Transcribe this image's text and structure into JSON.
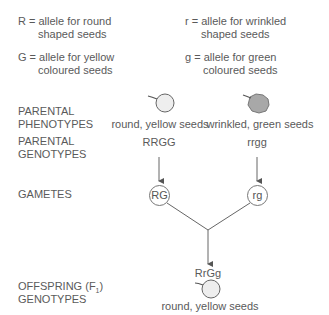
{
  "key": {
    "R": {
      "line1": "R = allele for round",
      "line2": "shaped seeds"
    },
    "r": {
      "line1": "r = allele for wrinkled",
      "line2": "shaped seeds"
    },
    "G": {
      "line1": "G = allele for yellow",
      "line2": "coloured seeds"
    },
    "g": {
      "line1": "g = allele for green",
      "line2": "coloured seeds"
    }
  },
  "rows": {
    "parental_phenotypes": {
      "line1": "PARENTAL",
      "line2": "PHENOTYPES"
    },
    "parental_genotypes": {
      "line1": "PARENTAL",
      "line2": "GENOTYPES"
    },
    "gametes": "GAMETES",
    "offspring": {
      "line1_prefix": "OFFSPRING (F",
      "line1_sub": "1",
      "line1_suffix": ")",
      "line2": "GENOTYPES"
    }
  },
  "parent1": {
    "phenotype": "round, yellow seeds",
    "genotype": "RRGG",
    "gamete": "RG",
    "seed_icon": "round-seed-icon"
  },
  "parent2": {
    "phenotype": "wrinkled, green seeds",
    "genotype": "rrgg",
    "gamete": "rg",
    "seed_icon": "wrinkled-seed-icon"
  },
  "offspring": {
    "genotype": "RrGg",
    "phenotype": "round, yellow seeds",
    "seed_icon": "round-seed-icon"
  },
  "colors": {
    "line": "#666666",
    "round_seed_fill": "#eeeeee",
    "wrinkled_seed_fill": "#a8a8a8"
  }
}
